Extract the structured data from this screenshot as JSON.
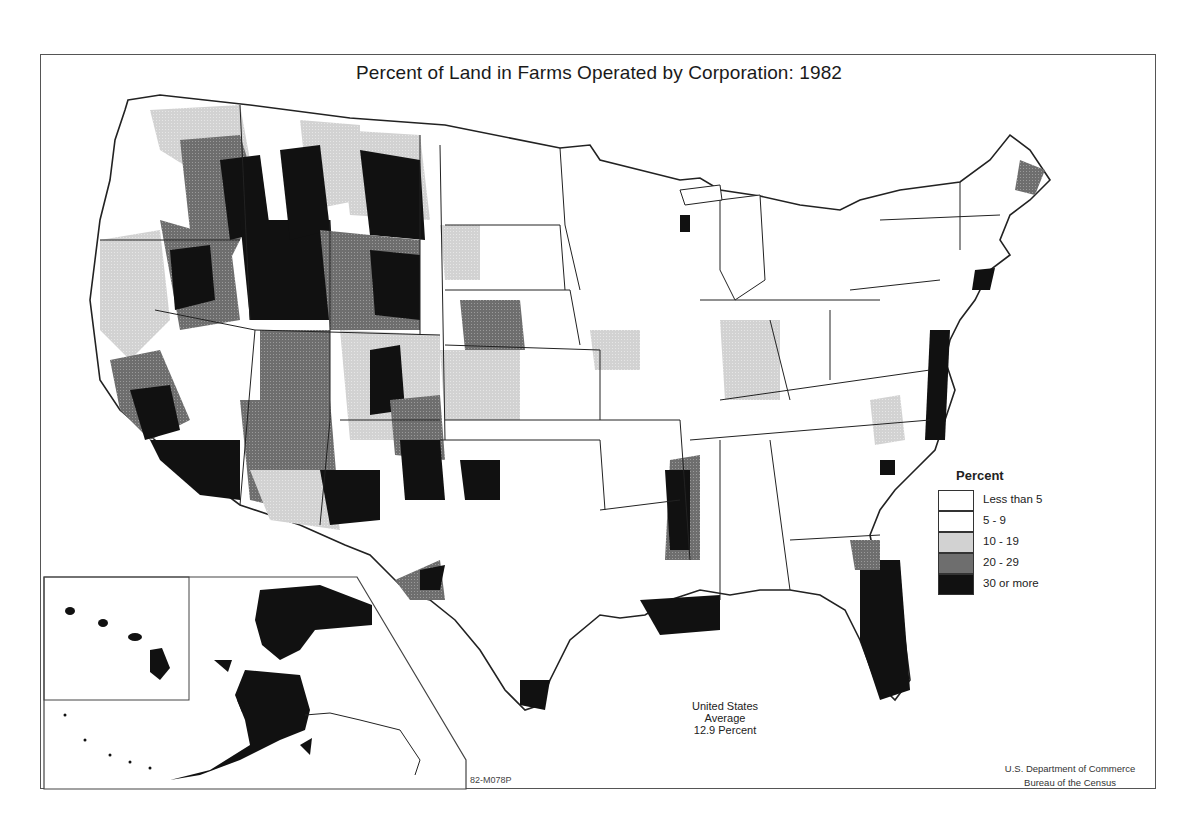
{
  "map": {
    "title": "Percent of Land in Farms Operated by Corporation: 1982",
    "legend": {
      "title": "Percent",
      "classes": [
        {
          "label": "Less than 5",
          "color": "#ffffff"
        },
        {
          "label": "5 - 9",
          "color": "#ffffff"
        },
        {
          "label": "10 - 19",
          "color": "#d2d2d2"
        },
        {
          "label": "20 - 29",
          "color": "#6e6e6e"
        },
        {
          "label": "30 or more",
          "color": "#111111"
        }
      ]
    },
    "annotation": {
      "line1": "United States",
      "line2": "Average",
      "line3": "12.9 Percent"
    },
    "source": {
      "line1": "U.S. Department of Commerce",
      "line2": "Bureau of the Census"
    },
    "map_code": "82-M078P",
    "insets": [
      "Hawaii",
      "Alaska"
    ],
    "colors": {
      "frame": "#555555",
      "boundary": "#222222",
      "class_10_19": "#d2d2d2",
      "class_20_29": "#6e6e6e",
      "class_30_plus": "#111111"
    }
  }
}
